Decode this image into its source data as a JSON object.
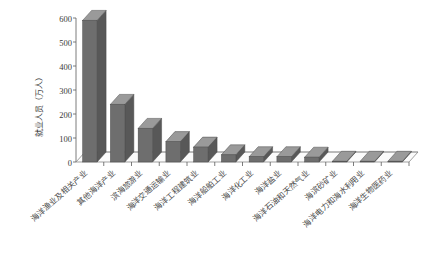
{
  "chart_data": {
    "type": "bar",
    "title": "",
    "subtitle": "",
    "xlabel": "",
    "ylabel": "就业人员（万人）",
    "ylim": [
      0,
      600
    ],
    "yticks": [
      0,
      100,
      200,
      300,
      400,
      500,
      600
    ],
    "ytick_labels": [
      "0",
      "100",
      "200",
      "300",
      "400",
      "500",
      "600"
    ],
    "grid": false,
    "legend": "none",
    "style_3d": true,
    "bar_color": "#6e6e6e",
    "bar_top_color": "#9a9a9a",
    "bar_side_color": "#585858",
    "categories": [
      "海洋渔业及相关产业",
      "其他海洋产业",
      "滨海旅游业",
      "海洋交通运输业",
      "海洋工程建筑业",
      "海洋船舶工业",
      "海洋化工业",
      "海洋盐业",
      "海洋石油和天然气业",
      "海滨砂矿业",
      "海洋电力和海水利用业",
      "海洋生物医药业"
    ],
    "values": [
      590,
      240,
      140,
      85,
      62,
      30,
      22,
      22,
      20,
      3,
      3,
      3
    ],
    "series": [
      {
        "name": "就业人员",
        "values": [
          590,
          240,
          140,
          85,
          62,
          30,
          22,
          22,
          20,
          3,
          3,
          3
        ]
      }
    ]
  },
  "axis": {
    "y_title": "就业人员（万人）",
    "y_tick_0": "0",
    "y_tick_1": "100",
    "y_tick_2": "200",
    "y_tick_3": "300",
    "y_tick_4": "400",
    "y_tick_5": "500",
    "y_tick_6": "600"
  },
  "colors": {
    "bar_fill": "#6e6e6e",
    "bar_top": "#9a9a9a",
    "bar_side": "#585858",
    "axis": "#5a5a5a",
    "background": "#ffffff",
    "text": "#3a3a3a"
  }
}
